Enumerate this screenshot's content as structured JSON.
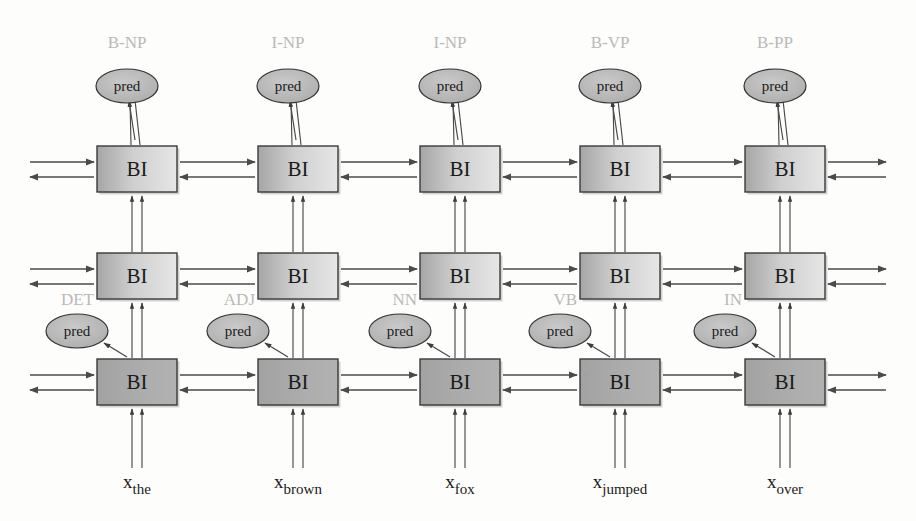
{
  "diagram": {
    "cell_label": "BI",
    "pred_label": "pred",
    "colors": {
      "box_stroke": "#3a3a3a",
      "box_fill_dark": "#a9a9a9",
      "box_fill_light": "#e2e2e2",
      "bottom_fill": "#a8a8a8",
      "ellipse_fill": "#b9b9b9",
      "ellipse_stroke": "#333333",
      "arrow": "#4a4a4a",
      "tag_text": "#b9b9b9",
      "text": "#1a1a1a",
      "background": "#fdfdfb"
    },
    "columns": [
      {
        "input_base": "x",
        "input_sub": "the",
        "pos_tag": "DET",
        "chunk_tag": "B-NP"
      },
      {
        "input_base": "x",
        "input_sub": "brown",
        "pos_tag": "ADJ",
        "chunk_tag": "I-NP"
      },
      {
        "input_base": "x",
        "input_sub": "fox",
        "pos_tag": "NN",
        "chunk_tag": "I-NP"
      },
      {
        "input_base": "x",
        "input_sub": "jumped",
        "pos_tag": "VB",
        "chunk_tag": "B-VP"
      },
      {
        "input_base": "x",
        "input_sub": "over",
        "pos_tag": "IN",
        "chunk_tag": "B-PP"
      }
    ],
    "layers": [
      {
        "name": "top-layer",
        "role": "chunking"
      },
      {
        "name": "middle-layer",
        "role": "pos-tagging"
      },
      {
        "name": "bottom-layer",
        "role": "input-encoding"
      }
    ]
  }
}
